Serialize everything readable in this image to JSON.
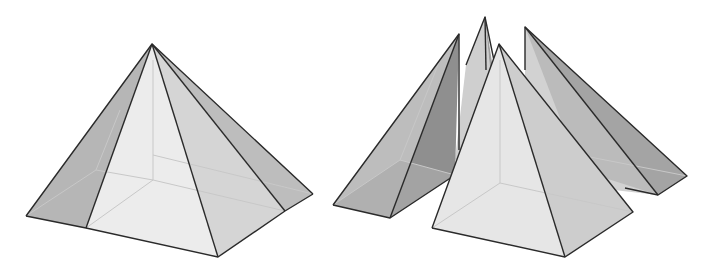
{
  "figure": {
    "left": {
      "label": "assembled-pyramid",
      "colors": {
        "front_face": "#e9e9e9",
        "right_face": "#d6d6d6",
        "side_dark": "#b3b3b3",
        "edge": "#2a2a2a",
        "hidden": "#c8c8c8"
      }
    },
    "right": {
      "label": "exploded-pyramid",
      "pieces": [
        "left-wedge",
        "back-wedge",
        "central-pyramid",
        "right-wedge"
      ],
      "colors": {
        "light": "#e6e6e6",
        "mid": "#c9c9c9",
        "dark": "#9a9a9a",
        "darker": "#8a8a8a"
      }
    }
  }
}
